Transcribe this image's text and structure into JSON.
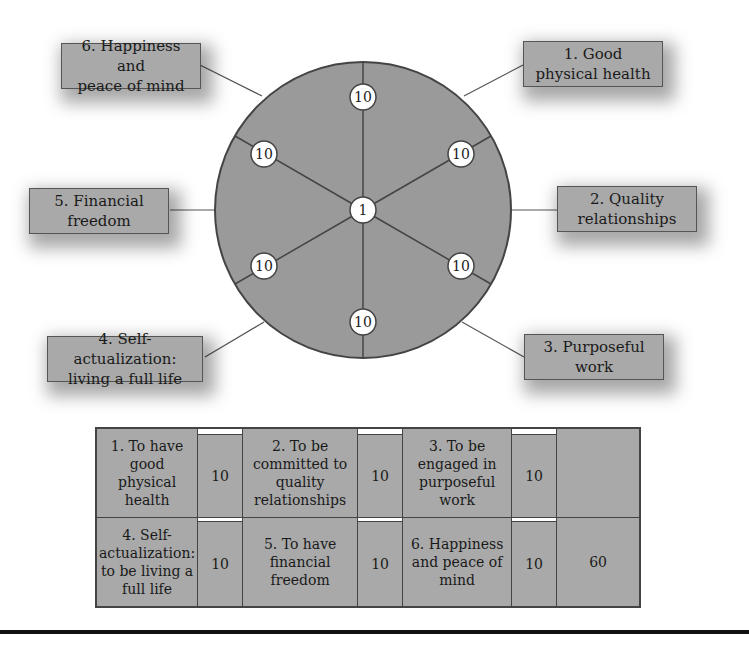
{
  "wheel": {
    "center_value": "1",
    "spoke_values": [
      "10",
      "10",
      "10",
      "10",
      "10",
      "10"
    ],
    "colors": {
      "fill": "#9a9a9a",
      "stroke": "#444444",
      "node": "#ffffff"
    }
  },
  "labels": [
    {
      "id": 1,
      "text_lines": [
        "1. Good",
        "physical health"
      ]
    },
    {
      "id": 2,
      "text_lines": [
        "2. Quality",
        "relationships"
      ]
    },
    {
      "id": 3,
      "text_lines": [
        "3. Purposeful",
        "work"
      ]
    },
    {
      "id": 4,
      "text_lines": [
        "4. Self-actualization:",
        "living a full life"
      ]
    },
    {
      "id": 5,
      "text_lines": [
        "5. Financial",
        "freedom"
      ]
    },
    {
      "id": 6,
      "text_lines": [
        "6. Happiness and",
        "peace of mind"
      ]
    }
  ],
  "table": {
    "row1": [
      {
        "goal": "1. To have good physical health",
        "score": "10"
      },
      {
        "goal": "2. To be committed to quality relationships",
        "score": "10"
      },
      {
        "goal": "3. To be engaged in purposeful work",
        "score": "10"
      }
    ],
    "row2": [
      {
        "goal": "4. Self-actualization: to be living a full life",
        "score": "10"
      },
      {
        "goal": "5. To have financial freedom",
        "score": "10"
      },
      {
        "goal": "6. Happiness and peace of mind",
        "score": "10"
      }
    ],
    "total": "60"
  }
}
